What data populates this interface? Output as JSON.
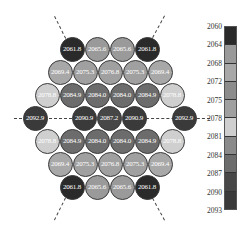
{
  "chart_data": {
    "type": "heatmap",
    "layout": "hexagonal grid of circles",
    "title": "",
    "colorbar": {
      "ticks": [
        "2060",
        "2064",
        "2068",
        "2072",
        "2075",
        "2078",
        "2081",
        "2084",
        "2087",
        "2090",
        "2093"
      ],
      "min": 2060,
      "max": 2093,
      "orientation": "vertical",
      "colors": [
        "#2a2a2a",
        "#9a9a9a",
        "#a8a8a8",
        "#8c8c8c",
        "#a0a0a0",
        "#cfcfcf",
        "#8a8a8a",
        "#6c6c6c",
        "#474747",
        "#3a3a3a",
        "#5a5a5a"
      ]
    },
    "rows": [
      {
        "y": 49,
        "cells": [
          {
            "x": 72,
            "v": "2061.8"
          },
          {
            "x": 97,
            "v": "2065.6"
          },
          {
            "x": 122,
            "v": "2065.6"
          },
          {
            "x": 147,
            "v": "2061.8"
          }
        ]
      },
      {
        "y": 72,
        "cells": [
          {
            "x": 60,
            "v": "2069.4"
          },
          {
            "x": 85,
            "v": "2075.3"
          },
          {
            "x": 110,
            "v": "2076.8"
          },
          {
            "x": 135,
            "v": "2075.3"
          },
          {
            "x": 160,
            "v": "2069.4"
          }
        ]
      },
      {
        "y": 95,
        "cells": [
          {
            "x": 47,
            "v": "2078.8"
          },
          {
            "x": 72,
            "v": "2084.9"
          },
          {
            "x": 97,
            "v": "2084.0"
          },
          {
            "x": 122,
            "v": "2084.0"
          },
          {
            "x": 147,
            "v": "2084.9"
          },
          {
            "x": 172,
            "v": "2078.8"
          }
        ]
      },
      {
        "y": 118,
        "cells": [
          {
            "x": 35,
            "v": "2092.9"
          },
          {
            "x": 84,
            "v": "2090.9"
          },
          {
            "x": 109,
            "v": "2087.2"
          },
          {
            "x": 134,
            "v": "2090.9"
          },
          {
            "x": 184,
            "v": "2092.9"
          }
        ]
      },
      {
        "y": 141,
        "cells": [
          {
            "x": 47,
            "v": "2078.8"
          },
          {
            "x": 72,
            "v": "2084.9"
          },
          {
            "x": 97,
            "v": "2084.0"
          },
          {
            "x": 122,
            "v": "2084.0"
          },
          {
            "x": 147,
            "v": "2084.9"
          },
          {
            "x": 172,
            "v": "2078.8"
          }
        ]
      },
      {
        "y": 164,
        "cells": [
          {
            "x": 60,
            "v": "2069.4"
          },
          {
            "x": 85,
            "v": "2075.3"
          },
          {
            "x": 110,
            "v": "2076.8"
          },
          {
            "x": 135,
            "v": "2075.3"
          },
          {
            "x": 160,
            "v": "2069.4"
          }
        ]
      },
      {
        "y": 187,
        "cells": [
          {
            "x": 72,
            "v": "2061.8"
          },
          {
            "x": 97,
            "v": "2065.6"
          },
          {
            "x": 122,
            "v": "2065.6"
          },
          {
            "x": 147,
            "v": "2061.8"
          }
        ]
      }
    ],
    "annotations": [
      "dashed symmetry lines: horizontal through middle row, diagonals through four corner circles"
    ]
  }
}
